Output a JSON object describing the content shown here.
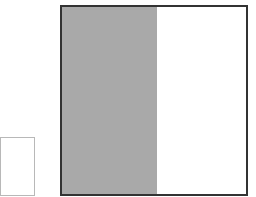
{
  "diagram": {
    "colors": {
      "shade": "#a9a9a9",
      "large_border": "#333333",
      "small_border": "#b8b8b8",
      "background": "#ffffff"
    },
    "small_square": {
      "x": 0,
      "y": 137,
      "w": 35,
      "h": 59
    },
    "large_square": {
      "x": 60,
      "y": 5,
      "w": 188,
      "h": 191
    },
    "shaded_region": {
      "width": 95
    }
  }
}
